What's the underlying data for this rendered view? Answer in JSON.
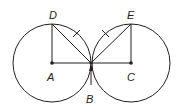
{
  "diagram": {
    "type": "geometry",
    "stroke_color": "#231f20",
    "points": {
      "A": {
        "label": "A",
        "x": 52,
        "y": 63
      },
      "C": {
        "label": "C",
        "x": 131,
        "y": 63
      },
      "D": {
        "label": "D",
        "x": 52,
        "y": 24
      },
      "E": {
        "label": "E",
        "x": 131,
        "y": 24
      },
      "B": {
        "label": "B",
        "x": 91,
        "y": 63
      }
    },
    "circles": [
      {
        "center": "A",
        "radius": 39
      },
      {
        "center": "C",
        "radius": 39
      }
    ],
    "segments": [
      "AD",
      "AC",
      "CE",
      "DB",
      "EB"
    ],
    "congruence_marks": [
      "DB",
      "EB"
    ],
    "labels": {
      "D": "D",
      "E": "E",
      "A": "A",
      "C": "C",
      "B": "B"
    }
  }
}
